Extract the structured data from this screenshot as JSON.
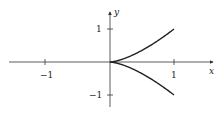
{
  "chart_data": {
    "type": "line",
    "title": "",
    "xlabel": "x",
    "ylabel": "y",
    "xlim": [
      -1.55,
      1.6
    ],
    "ylim": [
      -1.3,
      1.5
    ],
    "xticks": [
      -1,
      1
    ],
    "yticks": [
      1,
      -1
    ],
    "xtick_labels": [
      "−1",
      "1"
    ],
    "ytick_labels": [
      "1",
      "−1"
    ],
    "grid": false,
    "legend": null,
    "series": [
      {
        "name": "upper branch (y = x^(3/2))",
        "x": [
          0,
          0.1,
          0.2,
          0.3,
          0.4,
          0.5,
          0.6,
          0.7,
          0.8,
          0.9,
          1.0
        ],
        "y": [
          0,
          0.032,
          0.089,
          0.164,
          0.253,
          0.354,
          0.465,
          0.586,
          0.716,
          0.854,
          1.0
        ]
      },
      {
        "name": "lower branch (y = -x^(3/2))",
        "x": [
          0,
          0.1,
          0.2,
          0.3,
          0.4,
          0.5,
          0.6,
          0.7,
          0.8,
          0.9,
          1.0
        ],
        "y": [
          0,
          -0.032,
          -0.089,
          -0.164,
          -0.253,
          -0.354,
          -0.465,
          -0.586,
          -0.716,
          -0.854,
          -1.0
        ]
      }
    ],
    "colors": {
      "axis": "#333333",
      "curve": "#222222"
    }
  },
  "labels": {
    "x_axis": "x",
    "y_axis": "y",
    "x_tick_neg": "−1",
    "x_tick_pos": "1",
    "y_tick_pos": "1",
    "y_tick_neg": "−1"
  }
}
